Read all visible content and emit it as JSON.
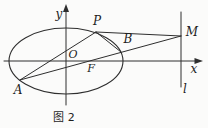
{
  "figure": {
    "caption": "图 2",
    "labels": {
      "axis_y": "y",
      "axis_x": "x",
      "origin": "O",
      "focus": "F",
      "point_a": "A",
      "point_p": "P",
      "point_b": "B",
      "point_m": "M",
      "line_l": "l"
    },
    "colors": {
      "stroke": "#2e2e2e",
      "background": "#fbfbfa"
    }
  }
}
